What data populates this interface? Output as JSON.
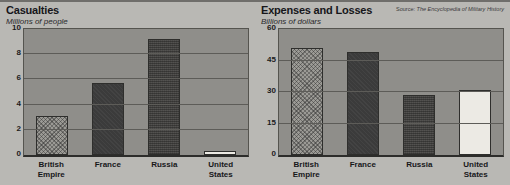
{
  "source": {
    "label": "Source:",
    "title": "The Encyclopedia of Military History"
  },
  "chart_data": [
    {
      "type": "bar",
      "title": "Casualties",
      "subtitle": "Millions of people",
      "xlabel": "",
      "ylabel": "Millions of people",
      "categories": [
        "British\nEmpire",
        "France",
        "Russia",
        "United\nStates"
      ],
      "values": [
        3.1,
        5.7,
        9.2,
        0.3
      ],
      "ylim": [
        0,
        10
      ],
      "yticks": [
        0,
        2,
        4,
        6,
        8,
        10
      ],
      "grid": true,
      "legend": "none",
      "bar_fills": [
        "hatch",
        "dark",
        "dark-speckle",
        "white"
      ]
    },
    {
      "type": "bar",
      "title": "Expenses and Losses",
      "subtitle": "Billions of dollars",
      "xlabel": "",
      "ylabel": "Billions of dollars",
      "categories": [
        "British\nEmpire",
        "France",
        "Russia",
        "United\nStates"
      ],
      "values": [
        51,
        49,
        28.5,
        31
      ],
      "ylim": [
        0,
        60
      ],
      "yticks": [
        0,
        15,
        30,
        45,
        60
      ],
      "grid": true,
      "legend": "none",
      "bar_fills": [
        "hatch",
        "dark",
        "dark-speckle",
        "white"
      ]
    }
  ],
  "colors": {
    "background": "#b9b8b4",
    "plot_background": "#8f8e8a",
    "grid": "#5d5c58",
    "axis": "#2c2c2a",
    "text": "#16161a",
    "bar_light": "#9b9a95",
    "bar_dark": "#3b3b3b",
    "bar_speckle": "#4a4947",
    "bar_white": "#eceae4"
  }
}
